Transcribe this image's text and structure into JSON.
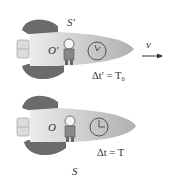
{
  "diagram": {
    "top_ship": {
      "frame_label": "S′",
      "observer_label": "O′",
      "velocity_label": "v",
      "equation": "Δt′ = T₀"
    },
    "bottom_ship": {
      "frame_label": "S",
      "observer_label": "O",
      "equation": "Δt = T"
    },
    "colors": {
      "fin": "#6b6b6b",
      "hull_light": "#e6e6e6",
      "hull_dark": "#b5b5b5",
      "text": "#333333"
    }
  }
}
